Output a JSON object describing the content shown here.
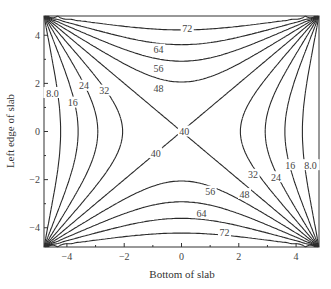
{
  "chart_data": {
    "type": "contour",
    "title": "",
    "xlabel": "Bottom of slab",
    "ylabel": "Left edge of slab",
    "xlim": [
      -4.8,
      4.8
    ],
    "ylim": [
      -4.8,
      4.8
    ],
    "xticks": [
      -4,
      -2,
      0,
      2,
      4
    ],
    "yticks": [
      -4,
      -2,
      0,
      2,
      4
    ],
    "grid": false,
    "contour_levels": [
      8.0,
      16,
      24,
      32,
      40,
      48,
      56,
      64,
      72
    ],
    "contour_labels": [
      {
        "text": "72",
        "x": 0.2,
        "y": 4.3
      },
      {
        "text": "64",
        "x": -0.8,
        "y": 3.4
      },
      {
        "text": "56",
        "x": -0.8,
        "y": 2.6
      },
      {
        "text": "48",
        "x": -0.8,
        "y": 1.8
      },
      {
        "text": "32",
        "x": -2.7,
        "y": 1.7
      },
      {
        "text": "24",
        "x": -3.4,
        "y": 1.9
      },
      {
        "text": "16",
        "x": -3.8,
        "y": 1.2
      },
      {
        "text": "8.0",
        "x": -4.5,
        "y": 1.6
      },
      {
        "text": "40",
        "x": 0.1,
        "y": 0.0
      },
      {
        "text": "40",
        "x": -0.9,
        "y": -0.9
      },
      {
        "text": "32",
        "x": 2.5,
        "y": -1.8
      },
      {
        "text": "24",
        "x": 3.3,
        "y": -1.9
      },
      {
        "text": "16",
        "x": 3.8,
        "y": -1.4
      },
      {
        "text": "8.0",
        "x": 4.5,
        "y": -1.4
      },
      {
        "text": "56",
        "x": 1.0,
        "y": -2.5
      },
      {
        "text": "48",
        "x": 2.2,
        "y": -2.6
      },
      {
        "text": "64",
        "x": 0.7,
        "y": -3.4
      },
      {
        "text": "72",
        "x": 1.5,
        "y": -4.2
      }
    ]
  }
}
